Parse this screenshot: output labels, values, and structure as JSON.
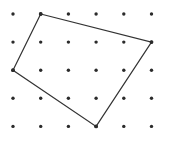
{
  "figure": {
    "width": 169,
    "height": 149,
    "background_color": "#ffffff"
  },
  "grid": {
    "name": "dot-grid",
    "columns": 6,
    "rows": 5,
    "origin_x": 13,
    "origin_y": 14,
    "spacing_x": 27.7,
    "spacing_y": 28.1,
    "dot_radius": 1.7,
    "dot_color": "#2b2b2b",
    "column_x": [
      13,
      40.7,
      68.4,
      96.1,
      123.8,
      151.5
    ],
    "row_y": [
      14,
      42.1,
      70.2,
      98.3,
      126.4
    ]
  },
  "chart_data": {
    "type": "scatter",
    "xlabel": "",
    "ylabel": "",
    "grid": true,
    "legend": "none",
    "xlim": [
      0,
      5
    ],
    "ylim": [
      0,
      4
    ],
    "categories": [
      "col0",
      "col1",
      "col2",
      "col3",
      "col4",
      "col5"
    ],
    "values": [
      0,
      1,
      2,
      3,
      4,
      5
    ],
    "dots": [
      {
        "col": 0,
        "row": 0
      },
      {
        "col": 1,
        "row": 0
      },
      {
        "col": 2,
        "row": 0
      },
      {
        "col": 3,
        "row": 0
      },
      {
        "col": 4,
        "row": 0
      },
      {
        "col": 5,
        "row": 0
      },
      {
        "col": 0,
        "row": 1
      },
      {
        "col": 1,
        "row": 1
      },
      {
        "col": 2,
        "row": 1
      },
      {
        "col": 3,
        "row": 1
      },
      {
        "col": 4,
        "row": 1
      },
      {
        "col": 5,
        "row": 1
      },
      {
        "col": 0,
        "row": 2
      },
      {
        "col": 1,
        "row": 2
      },
      {
        "col": 2,
        "row": 2
      },
      {
        "col": 3,
        "row": 2
      },
      {
        "col": 4,
        "row": 2
      },
      {
        "col": 5,
        "row": 2
      },
      {
        "col": 0,
        "row": 3
      },
      {
        "col": 1,
        "row": 3
      },
      {
        "col": 2,
        "row": 3
      },
      {
        "col": 3,
        "row": 3
      },
      {
        "col": 4,
        "row": 3
      },
      {
        "col": 5,
        "row": 3
      },
      {
        "col": 0,
        "row": 4
      },
      {
        "col": 1,
        "row": 4
      },
      {
        "col": 2,
        "row": 4
      },
      {
        "col": 3,
        "row": 4
      },
      {
        "col": 4,
        "row": 4
      },
      {
        "col": 5,
        "row": 4
      }
    ],
    "series": [
      {
        "name": "quadrilateral",
        "closed": true,
        "stroke_color": "#333333",
        "stroke_width": 1.2,
        "fill": "none",
        "vertices": [
          {
            "label": "top",
            "col": 1,
            "row": 0,
            "x": 40.7,
            "y": 14
          },
          {
            "label": "right",
            "col": 5,
            "row": 1,
            "x": 151.5,
            "y": 42.1
          },
          {
            "label": "bottom",
            "col": 3,
            "row": 4,
            "x": 96.1,
            "y": 126.4
          },
          {
            "label": "left",
            "col": 0,
            "row": 2,
            "x": 13,
            "y": 70.2
          }
        ],
        "points_svg": "40.7,14 151.5,42.1 96.1,126.4 13,70.2"
      }
    ]
  }
}
